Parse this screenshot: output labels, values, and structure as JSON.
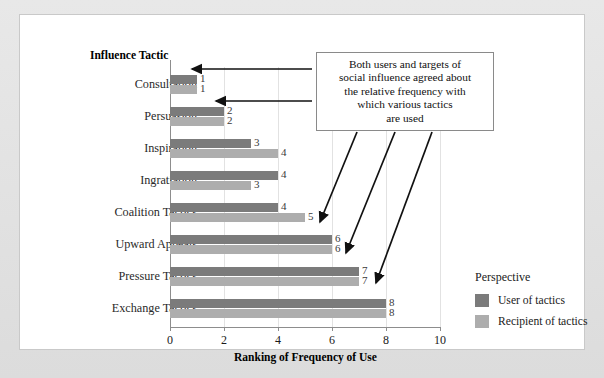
{
  "chart_data": {
    "type": "bar",
    "orientation": "horizontal",
    "title": "",
    "xlabel": "Ranking of Frequency of Use",
    "ylabel": "Influence Tactic",
    "xlim": [
      0,
      10
    ],
    "xticks": [
      0,
      2,
      4,
      6,
      8,
      10
    ],
    "grid": true,
    "categories": [
      "Consultation",
      "Persuasion",
      "Inspiration",
      "Ingratiation",
      "Coalition Tactics",
      "Upward Appeals",
      "Pressure Tactics",
      "Exchange Tactics"
    ],
    "series": [
      {
        "name": "User of tactics",
        "color": "#7b7b7b",
        "values": [
          1,
          2,
          3,
          4,
          4,
          6,
          7,
          8
        ]
      },
      {
        "name": "Recipient of tactics",
        "color": "#adadad",
        "values": [
          1,
          2,
          4,
          3,
          5,
          6,
          7,
          8
        ]
      }
    ],
    "legend": {
      "title": "Perspective",
      "position": "right",
      "entries": [
        {
          "label": "User of tactics",
          "color": "#7b7b7b"
        },
        {
          "label": "Recipient of tactics",
          "color": "#adadad"
        }
      ]
    },
    "annotations": [
      {
        "text": "Both users and targets of social influence agreed about the relative frequency with which various tactics are used",
        "lines": [
          "Both users and targets of",
          "social influence agreed about",
          "the relative frequency with",
          "which various tactics",
          "are used"
        ],
        "arrow_targets": [
          "Consultation",
          "Persuasion",
          "Upward Appeals",
          "Pressure Tactics",
          "Exchange Tactics"
        ]
      }
    ]
  }
}
